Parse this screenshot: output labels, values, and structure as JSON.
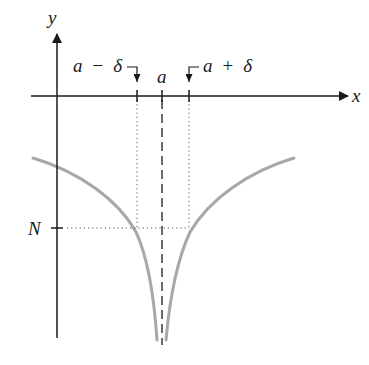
{
  "diagram": {
    "title": "",
    "axes": {
      "x_label": "x",
      "y_label": "y"
    },
    "x_ticks": [
      {
        "id": "a-minus-delta",
        "label_var": "a",
        "label_op": "−",
        "label_sym": "δ",
        "x": 137
      },
      {
        "id": "a",
        "label_var": "a",
        "x": 162
      },
      {
        "id": "a-plus-delta",
        "label_var": "a",
        "label_op": "+",
        "label_sym": "δ",
        "x": 189
      }
    ],
    "y_ticks": [
      {
        "id": "N",
        "label": "N",
        "y": 228
      }
    ],
    "curve": {
      "description": "function with vertical asymptote at x = a, tending to −∞",
      "color": "#a8a8a8"
    },
    "asymptote": {
      "style": "dashed",
      "at": "a"
    },
    "guide_lines": {
      "style": "dotted",
      "color": "#555555"
    },
    "colors": {
      "axis": "#1a1a1a",
      "curve": "#a8a8a8",
      "background": "#ffffff"
    }
  }
}
